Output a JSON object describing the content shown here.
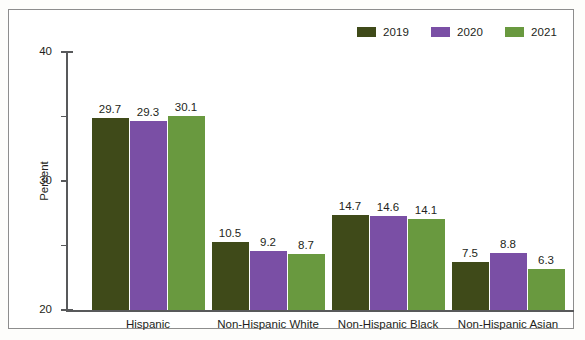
{
  "chart_data": {
    "type": "bar",
    "title": "",
    "xlabel": "",
    "ylabel": "Percent",
    "ylim": [
      0,
      40
    ],
    "yticks": [
      0,
      10,
      20,
      30,
      40
    ],
    "grid": false,
    "legend_position": "top-right",
    "categories": [
      "Hispanic",
      "Non-Hispanic White",
      "Non-Hispanic Black",
      "Non-Hispanic Asian"
    ],
    "series": [
      {
        "name": "2019",
        "color": "#3f4a19",
        "values": [
          29.7,
          10.5,
          14.7,
          7.5
        ],
        "labels": [
          "29.7",
          "10.5",
          "14.7",
          "7.5"
        ]
      },
      {
        "name": "2020",
        "color": "#7a4fa5",
        "values": [
          29.3,
          9.2,
          14.6,
          8.8
        ],
        "labels": [
          "29.3",
          "9.2",
          "14.6",
          "8.8"
        ]
      },
      {
        "name": "2021",
        "color": "#69993f",
        "values": [
          30.1,
          8.7,
          14.1,
          6.3
        ],
        "labels": [
          "30.1",
          "8.7",
          "14.1",
          "6.3"
        ]
      }
    ],
    "ytick_labels": [
      "0",
      "10",
      "20",
      "30",
      "40"
    ]
  },
  "legend": {
    "entries": [
      {
        "label": "2019",
        "color": "#3f4a19"
      },
      {
        "label": "2020",
        "color": "#7a4fa5"
      },
      {
        "label": "2021",
        "color": "#69993f"
      }
    ]
  },
  "axis": {
    "y_title": "Percent"
  },
  "colors": {
    "axis": "#58595b",
    "text": "#231f20",
    "frame": "#8d8d8d",
    "background": "#ffffff"
  }
}
